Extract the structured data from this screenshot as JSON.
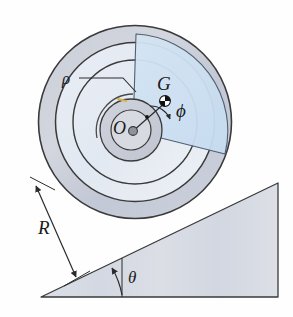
{
  "figure": {
    "background_color": "#fefefe",
    "stroke_color": "#3a3a3a",
    "labels": {
      "outer_radius": "R",
      "inner_radius": "ρ",
      "center": "O",
      "mass_center": "G",
      "offset_angle": "ϕ",
      "incline_angle": "θ"
    },
    "colors": {
      "rim_fill": "#c3c9d6",
      "disc_fill": "#e3eaf3",
      "sector_fill": "#cfe2f2",
      "hub_fill": "#c8ccd6",
      "incline_fill": "#d8dce4",
      "outline": "#3a3a3a",
      "marker_dark": "#101010",
      "marker_light": "#ffffff",
      "rho_tick": "#d8b24a"
    },
    "geometry": {
      "wheel_center_x": 135,
      "wheel_center_y": 122,
      "outer_radius_px": 97,
      "rim_inner_radius_px": 80,
      "disc_radius_px": 62,
      "hub_outer_radius_px": 31,
      "hub_inner_radius_px": 20,
      "rho_radius_px": 36,
      "incline_apex_x": 41,
      "incline_apex_y": 297,
      "incline_top_x": 278,
      "incline_top_y": 183,
      "incline_base_y": 297,
      "incline_angle_deg": 26,
      "phi_angle_deg": 38,
      "mass_center_x": 165,
      "mass_center_y": 101
    },
    "elements": {
      "outer_rim": "outer annular rim band",
      "inner_disc": "inner light disc",
      "sector_wedge": "shaded angular sector from O",
      "hub": "central hub rings",
      "rho_arc": "arc of radius rho around O",
      "leader_line": "leader line from rho label to arc",
      "dimension_line_R": "double headed dimension arrow for R",
      "incline_triangle": "inclined plane wedge",
      "theta_arc": "curved arrow marking theta",
      "com_marker": "center of mass quartered circle marker",
      "hub_dot": "solid dot at center O",
      "small_dot": "small reference dot inside sector"
    }
  }
}
